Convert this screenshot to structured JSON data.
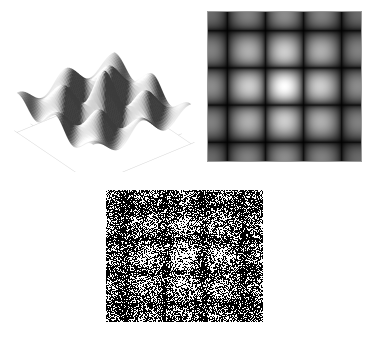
{
  "figure": {
    "background_color": "#ffffff",
    "width": 373,
    "height": 339,
    "panel_count": 3,
    "caption": "",
    "title": ""
  },
  "panels": [
    {
      "id": "surface3d",
      "name": "3d-surface-plot",
      "title": "",
      "render_type": "surface3d",
      "x": 8,
      "y": 4,
      "w": 192,
      "h": 168,
      "axes": {
        "visible": true,
        "frame_color": "#cfcfcf",
        "tick_color": "#c4c4c4",
        "tick_count_x": 7,
        "tick_count_y": 7,
        "xlabel": "",
        "ylabel": "",
        "zlabel": "",
        "xticklabels": [],
        "yticklabels": [],
        "zticklabels": [],
        "grid": false,
        "box": "floor-only"
      },
      "surface": {
        "colormap": "gray",
        "shading": "gouraud",
        "edge_color": "none",
        "light_azimuth_deg": -45,
        "light_elevation_deg": 55,
        "elev_deg": 32,
        "azim_deg": -38,
        "facecolor_min": "#3c3c3c",
        "facecolor_max": "#ffffff"
      }
    },
    {
      "id": "heatmap",
      "name": "grayscale-heatmap-image",
      "title": "",
      "render_type": "image",
      "x": 207,
      "y": 11,
      "w": 155,
      "h": 151,
      "axes": {
        "visible": false,
        "frame_color": "#9a9a9a",
        "xlabel": "",
        "ylabel": "",
        "xticklabels": [],
        "yticklabels": [],
        "grid": false
      },
      "image": {
        "colormap": "gray",
        "interpolation": "bilinear",
        "vmin": 0.0,
        "vmax": 1.0,
        "border_color": "#9a9a9a",
        "border_width_px": 1
      }
    },
    {
      "id": "dither",
      "name": "dithered-binary-noise-image",
      "title": "",
      "render_type": "dither",
      "x": 106,
      "y": 190,
      "w": 157,
      "h": 132,
      "axes": {
        "visible": false,
        "xlabel": "",
        "ylabel": "",
        "xticklabels": [],
        "yticklabels": [],
        "grid": false
      },
      "image": {
        "colormap": "binary",
        "levels": 2,
        "on_color": "#000000",
        "off_color": "#ffffff",
        "method": "random-threshold-halftone",
        "seed": 20240517
      }
    }
  ],
  "chart_data": {
    "type": "heatmap",
    "title": "",
    "xlabel": "",
    "ylabel": "",
    "function": "z(x,y) = cos(pi*x)*cos(pi*y) / (1 + 0.55*(x*x + y*y))",
    "x_range": [
      -2.0,
      2.0
    ],
    "y_range": [
      -2.0,
      2.0
    ],
    "z_range": [
      -1.0,
      1.0
    ],
    "grid_nx": 64,
    "grid_ny": 64,
    "intensity_transform": "abs",
    "legend": {
      "visible": false,
      "position": "none",
      "entries": []
    },
    "grid_visible": false,
    "annotations": [],
    "features": [
      {
        "label": "central lobe",
        "x": 0.0,
        "y": 0.0,
        "z": 1.0
      },
      {
        "label": "ring lobes",
        "x": 1.0,
        "y": 0.0,
        "z": -0.45
      },
      {
        "label": "corner lobes",
        "x": 1.5,
        "y": 1.5,
        "z": 0.25
      }
    ]
  }
}
